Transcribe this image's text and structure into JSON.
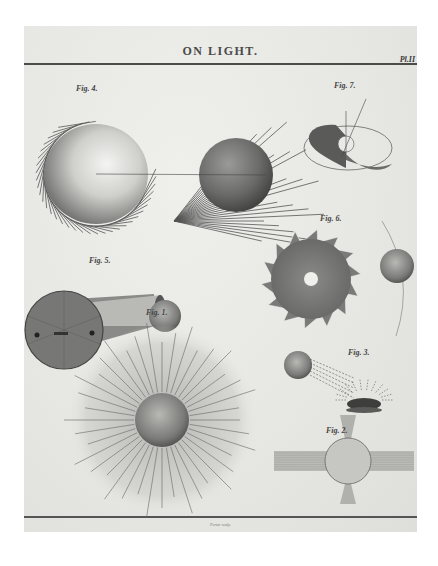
{
  "plate": {
    "title": "ON LIGHT.",
    "plate_number": "Pl.II",
    "engraver_credit": "Porter sculp."
  },
  "figures": [
    {
      "id": "fig-4",
      "label": "Fig. 4."
    },
    {
      "id": "fig-7",
      "label": "Fig. 7."
    },
    {
      "id": "fig-6",
      "label": "Fig. 6."
    },
    {
      "id": "fig-5",
      "label": "Fig. 5."
    },
    {
      "id": "fig-1",
      "label": "Fig. 1."
    },
    {
      "id": "fig-3",
      "label": "Fig. 3."
    },
    {
      "id": "fig-2",
      "label": "Fig. 2."
    }
  ],
  "colors": {
    "paper": "#e9e9e6",
    "ink": "#4a4a4a",
    "background": "#ffffff"
  }
}
